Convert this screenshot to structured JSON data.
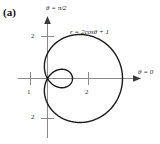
{
  "figure": {
    "panel_label": "(a)",
    "equation_label": "r = 2cosθ + 1",
    "axis_labels": {
      "vertical": "θ = π/2",
      "horizontal": "θ = 0"
    },
    "tick_labels": {
      "y_positive": "2",
      "y_negative": "2",
      "x_left": "1",
      "x_right": "2"
    },
    "colors": {
      "curve": "#1a1a1a",
      "axis": "#8a8a8a",
      "background": "#ffffff",
      "text": "#222222"
    }
  },
  "chart_data": {
    "type": "line",
    "title": "r = 2cosθ + 1",
    "plot_kind": "polar",
    "equation": "r = 2*cos(theta) + 1",
    "xlabel": "θ = 0",
    "ylabel": "θ = π/2",
    "grid": false,
    "legend": "none",
    "xlim": [
      -1.2,
      3.5
    ],
    "ylim": [
      -2.4,
      2.4
    ],
    "xticks": [
      1,
      2
    ],
    "yticks": [
      -2,
      2
    ],
    "xtick_labels": [
      "1",
      "2"
    ],
    "ytick_labels": [
      "2",
      "2"
    ],
    "annotations": [
      {
        "text": "(a)",
        "position": "top-left"
      },
      {
        "text": "r = 2cosθ + 1",
        "position": "upper-right-of-curve"
      }
    ],
    "series": [
      {
        "name": "limacon r = 2cos(theta) + 1",
        "theta_deg": [
          0,
          10,
          20,
          30,
          40,
          50,
          60,
          70,
          80,
          90,
          100,
          110,
          120,
          130,
          140,
          150,
          160,
          170,
          180,
          190,
          200,
          210,
          220,
          230,
          240,
          250,
          260,
          270,
          280,
          290,
          300,
          310,
          320,
          330,
          340,
          350,
          360
        ],
        "r": [
          3.0,
          2.97,
          2.88,
          2.73,
          2.53,
          2.29,
          2.0,
          1.68,
          1.35,
          1.0,
          0.65,
          0.32,
          0.0,
          -0.29,
          -0.53,
          -0.73,
          -0.88,
          -0.97,
          -1.0,
          -0.97,
          -0.88,
          -0.73,
          -0.53,
          -0.29,
          0.0,
          0.32,
          0.65,
          1.0,
          1.35,
          1.68,
          2.0,
          2.29,
          2.53,
          2.73,
          2.88,
          2.97,
          3.0
        ],
        "features": {
          "max_r": 3.0,
          "max_r_at_theta_deg": 0,
          "inner_loop": true,
          "inner_loop_min_r": -1.0,
          "inner_loop_extent_x": [
            -1.0,
            0.0
          ],
          "zero_crossings_theta_deg": [
            120,
            240
          ],
          "y_extreme_approx": 1.76
        }
      }
    ]
  }
}
